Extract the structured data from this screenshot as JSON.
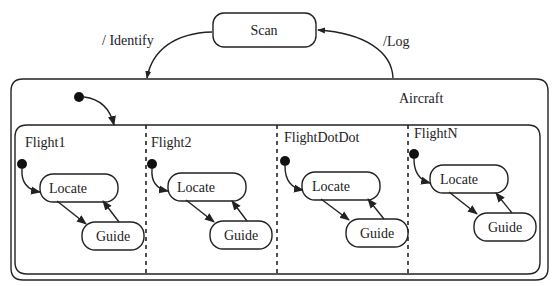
{
  "diagram": {
    "type": "statechart",
    "states": {
      "scan": "Scan",
      "aircraft": "Aircraft"
    },
    "transitions": {
      "to_aircraft": "/ Identify",
      "to_scan": "/Log"
    },
    "regions": [
      {
        "name": "Flight1",
        "states": [
          "Locate",
          "Guide"
        ]
      },
      {
        "name": "Flight2",
        "states": [
          "Locate",
          "Guide"
        ]
      },
      {
        "name": "FlightDotDot",
        "states": [
          "Locate",
          "Guide"
        ]
      },
      {
        "name": "FlightN",
        "states": [
          "Locate",
          "Guide"
        ]
      }
    ],
    "colors": {
      "stroke": "#222222",
      "background": "#ffffff"
    }
  }
}
